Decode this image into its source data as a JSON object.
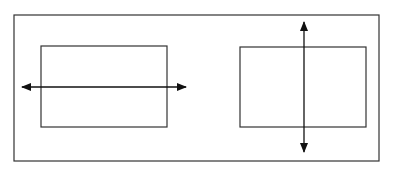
{
  "diagram": {
    "background": "#ffffff",
    "stroke_color": "#333333",
    "arrow_color": "#111111",
    "outer_frame": {
      "x": 14,
      "y": 15,
      "width": 365,
      "height": 146
    },
    "panels": [
      {
        "id": "left",
        "rect": {
          "x": 41,
          "y": 46,
          "width": 126,
          "height": 81
        },
        "arrow": {
          "orientation": "horizontal",
          "x1": 22,
          "y1": 87,
          "x2": 186,
          "y2": 87,
          "heads": "both"
        }
      },
      {
        "id": "right",
        "rect": {
          "x": 240,
          "y": 47,
          "width": 126,
          "height": 80
        },
        "arrow": {
          "orientation": "vertical",
          "x1": 304,
          "y1": 22,
          "x2": 304,
          "y2": 152,
          "heads": "both"
        }
      }
    ]
  }
}
